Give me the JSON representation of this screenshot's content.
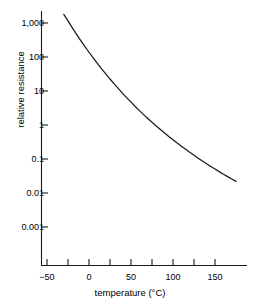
{
  "chart_data": {
    "type": "line",
    "title": "",
    "subtitle": "",
    "xlabel": "temperature (°C)",
    "ylabel": "relative resistance",
    "xlim": [
      -55,
      180
    ],
    "ylim": [
      0.0005,
      3000
    ],
    "yscale": "log",
    "xscale": "linear",
    "grid": false,
    "legend": null,
    "x_major_ticks": [
      -50,
      0,
      50,
      100,
      150
    ],
    "x_tick_labels": [
      "−50",
      "0",
      "50",
      "100",
      "150"
    ],
    "x_minor_ticks": [
      -25,
      25,
      75,
      125,
      175
    ],
    "y_major_ticks": [
      1000,
      100,
      10,
      1,
      0.1,
      0.01,
      0.001
    ],
    "y_tick_labels": [
      "1,000",
      "100",
      "10",
      "1",
      "0.1",
      "0.01",
      "0.001"
    ],
    "series": [
      {
        "name": "relative resistance",
        "color": "#1a1a1a",
        "x": [
          -30,
          -25,
          -20,
          -15,
          -10,
          -5,
          0,
          5,
          10,
          15,
          20,
          25,
          30,
          35,
          40,
          45,
          50,
          55,
          60,
          65,
          70,
          75,
          80,
          85,
          90,
          95,
          100,
          105,
          110,
          115,
          120,
          125,
          130,
          135,
          140,
          145,
          150,
          155,
          160,
          165,
          170,
          175
        ],
        "y": [
          1800,
          1150,
          730,
          470,
          310,
          205,
          138,
          94,
          65,
          45,
          32,
          22.5,
          16.2,
          11.7,
          8.5,
          6.3,
          4.7,
          3.5,
          2.65,
          2.02,
          1.55,
          1.2,
          0.94,
          0.74,
          0.58,
          0.46,
          0.37,
          0.295,
          0.238,
          0.193,
          0.157,
          0.129,
          0.106,
          0.0875,
          0.0726,
          0.0605,
          0.0506,
          0.0425,
          0.0358,
          0.0303,
          0.0258,
          0.022
        ]
      }
    ],
    "annotations": []
  },
  "axis": {
    "x_title": "temperature (°C)",
    "y_title": "relative resistance",
    "x_labels": [
      {
        "value": -50,
        "text": "−50"
      },
      {
        "value": 0,
        "text": "0"
      },
      {
        "value": 50,
        "text": "50"
      },
      {
        "value": 100,
        "text": "100"
      },
      {
        "value": 150,
        "text": "150"
      }
    ],
    "y_labels": [
      {
        "value": 1000,
        "text": "1,000"
      },
      {
        "value": 100,
        "text": "100"
      },
      {
        "value": 10,
        "text": "10"
      },
      {
        "value": 1,
        "text": "1"
      },
      {
        "value": 0.1,
        "text": "0.1"
      },
      {
        "value": 0.01,
        "text": "0.01"
      },
      {
        "value": 0.001,
        "text": "0.001"
      }
    ]
  },
  "style": {
    "axis_color": "#1a1a1a",
    "curve_color": "#1a1a1a",
    "background": "#ffffff"
  }
}
